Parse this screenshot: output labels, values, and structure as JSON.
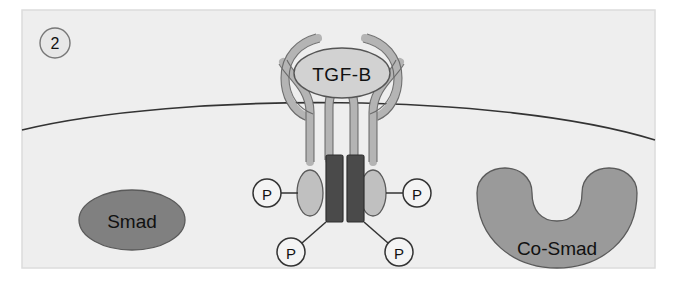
{
  "figure": {
    "panel_number": "2",
    "background_color": "#ffffff",
    "cell_fill": "#eeeeee",
    "frame_border_color": "#dcdcdc"
  },
  "ligand": {
    "label": "TGF-B",
    "shape": "ellipse",
    "fill": "#d2d2d2",
    "stroke": "#555555"
  },
  "receptor": {
    "arm_color": "#b4b4b4",
    "arm_stroke": "#5a5a5a",
    "kinase_domain_fill": "#4a4a4a",
    "kinase_domain_stroke": "#2f2f2f",
    "ectodomain_oval_fill": "#c0c0c0",
    "ectodomain_oval_stroke": "#5a5a5a"
  },
  "membrane": {
    "stroke": "#333333",
    "label": "plasma membrane"
  },
  "phosphates": [
    {
      "label": "P",
      "position": "left-outer"
    },
    {
      "label": "P",
      "position": "right-outer"
    },
    {
      "label": "P",
      "position": "left-lower"
    },
    {
      "label": "P",
      "position": "right-lower"
    }
  ],
  "proteins": [
    {
      "name": "smad",
      "label": "Smad",
      "shape": "ellipse",
      "fill": "#808080",
      "stroke": "#5a5a5a"
    },
    {
      "name": "co-smad",
      "label": "Co-Smad",
      "shape": "crescent",
      "fill": "#9a9a9a",
      "stroke": "#5a5a5a"
    }
  ]
}
